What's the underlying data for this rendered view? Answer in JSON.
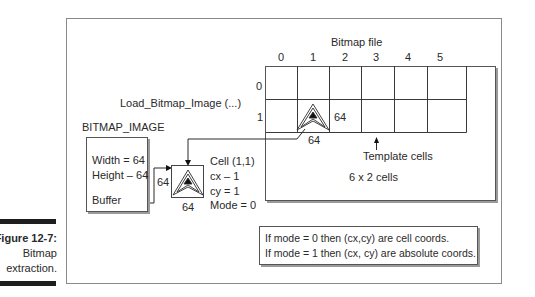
{
  "caption": {
    "figure_label": "Figure 12-7:",
    "line1": "Bitmap",
    "line2": "extraction."
  },
  "bitmap_file": {
    "title": "Bitmap file",
    "columns": [
      "0",
      "1",
      "2",
      "3",
      "4",
      "5"
    ],
    "rows": [
      "0",
      "1"
    ],
    "cell_width_label": "64",
    "cell_height_label": "64",
    "template_label": "Template cells",
    "grid_size_label": "6 x 2 cells"
  },
  "function_call": "Load_Bitmap_Image (...)",
  "bitmap_image": {
    "title": "BITMAP_IMAGE",
    "width_line": "Width = 64",
    "height_line": "Height – 64",
    "buffer_line": "Buffer"
  },
  "extracted_cell": {
    "width_label": "64",
    "height_label": "64",
    "params": [
      "Cell (1,1)",
      "cx – 1",
      "cy = 1",
      "Mode = 0"
    ]
  },
  "note": {
    "line1": "If mode = 0 then (cx,cy) are cell coords.",
    "line2": "If mode = 1 then (cx, cy) are absolute coords."
  }
}
